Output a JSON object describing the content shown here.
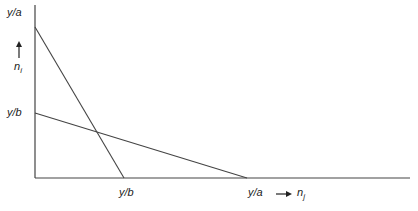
{
  "diagram": {
    "type": "budget-lines",
    "y_axis": {
      "top_label": "y/a",
      "mid_label": "y/b",
      "var": "n",
      "var_sub": "i",
      "arrow": "up-arrow"
    },
    "x_axis": {
      "tick1_label": "y/b",
      "tick2_label": "y/a",
      "var": "n",
      "var_sub": "j",
      "arrow": "right-arrow"
    },
    "lines": [
      {
        "name": "steep-line",
        "from": [
          "0",
          "y/a"
        ],
        "to": [
          "y/b",
          "0"
        ]
      },
      {
        "name": "shallow-line",
        "from": [
          "0",
          "y/b"
        ],
        "to": [
          "y/a",
          "0"
        ]
      }
    ],
    "line_color": "#444444"
  }
}
